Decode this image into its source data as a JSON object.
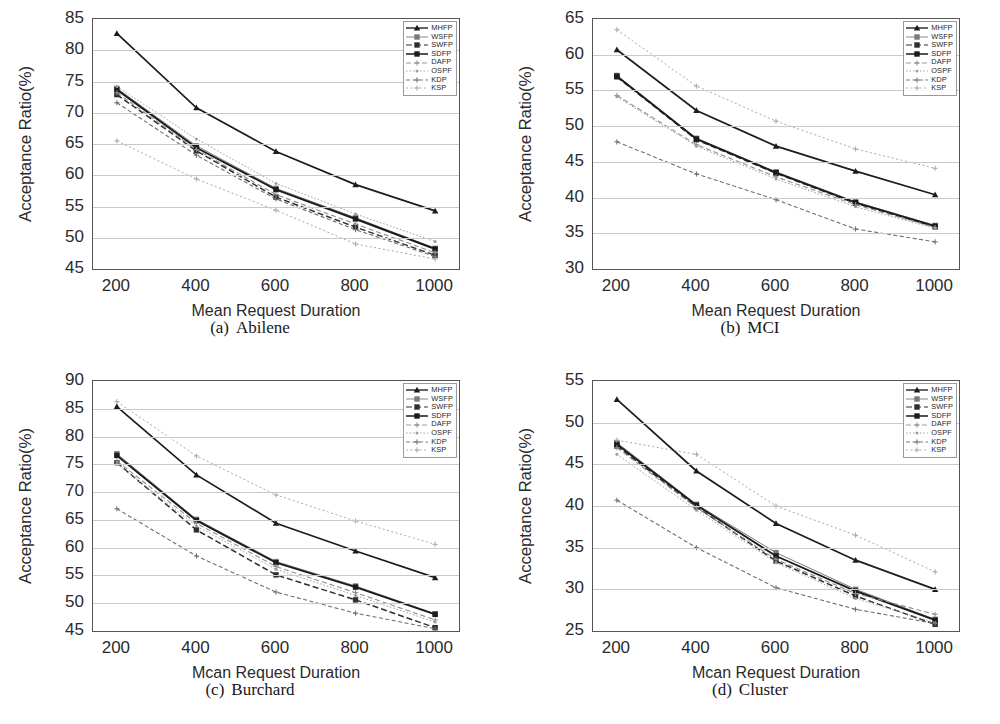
{
  "figure": {
    "xlabel": "Mean Request Duration",
    "xlabel_ocr_alt": "Mcan Request Duration",
    "ylabel": "Acceptance Ratio(%)",
    "series_names": [
      "MHFP",
      "WSFP",
      "SWFP",
      "SDFP",
      "DAFP",
      "OSPF",
      "KDP",
      "KSP"
    ]
  },
  "panels": [
    {
      "tag": "(a)",
      "name": "Abilene",
      "xlabel": "Mean Request Duration",
      "ylabel": "Acceptance Ratio(%)"
    },
    {
      "tag": "(b)",
      "name": "MCI",
      "xlabel": "Mean Request Duration",
      "ylabel": "Acceptance Ratio(%)"
    },
    {
      "tag": "(c)",
      "name": "Burchard",
      "xlabel": "Mcan Request Duration",
      "ylabel": "Acceptance Ratio(%)"
    },
    {
      "tag": "(d)",
      "name": "Cluster",
      "xlabel": "Mcan Request Duration",
      "ylabel": "Acceptance Ratio(%)"
    }
  ],
  "chart_data": [
    {
      "type": "line",
      "title": "(a) Abilene",
      "xlabel": "Mean Request Duration",
      "ylabel": "Acceptance Ratio(%)",
      "x": [
        200,
        400,
        600,
        800,
        1000
      ],
      "xticks": [
        200,
        400,
        600,
        800,
        1000
      ],
      "yticks": [
        45,
        50,
        55,
        60,
        65,
        70,
        75,
        80,
        85
      ],
      "xlim": [
        140,
        1060
      ],
      "ylim": [
        45,
        85
      ],
      "grid": true,
      "legend_position": "top-right",
      "series": [
        {
          "name": "MHFP",
          "values": [
            82.7,
            70.8,
            63.8,
            58.5,
            54.3
          ]
        },
        {
          "name": "WSFP",
          "values": [
            73.9,
            64.7,
            57.9,
            53.2,
            48.3
          ]
        },
        {
          "name": "SWFP",
          "values": [
            72.9,
            63.9,
            56.5,
            51.7,
            47.2
          ]
        },
        {
          "name": "SDFP",
          "values": [
            73.7,
            64.4,
            57.7,
            53.0,
            48.2
          ]
        },
        {
          "name": "DAFP",
          "values": [
            73.2,
            64.1,
            56.9,
            52.2,
            47.6
          ]
        },
        {
          "name": "OSPF",
          "values": [
            74.2,
            65.8,
            58.7,
            53.8,
            49.4
          ]
        },
        {
          "name": "KDP",
          "values": [
            71.6,
            63.2,
            56.2,
            51.3,
            47.0
          ]
        },
        {
          "name": "KSP",
          "values": [
            65.5,
            59.4,
            54.4,
            49.0,
            46.6
          ]
        }
      ]
    },
    {
      "type": "line",
      "title": "(b) MCI",
      "xlabel": "Mean Request Duration",
      "ylabel": "Acceptance Ratio(%)",
      "x": [
        200,
        400,
        600,
        800,
        1000
      ],
      "xticks": [
        200,
        400,
        600,
        800,
        1000
      ],
      "yticks": [
        30,
        35,
        40,
        45,
        50,
        55,
        60,
        65
      ],
      "xlim": [
        140,
        1060
      ],
      "ylim": [
        30,
        65
      ],
      "grid": true,
      "legend_position": "top-right",
      "series": [
        {
          "name": "MHFP",
          "values": [
            60.7,
            52.2,
            47.2,
            43.7,
            40.4
          ]
        },
        {
          "name": "WSFP",
          "values": [
            57.1,
            48.3,
            43.6,
            39.4,
            36.1
          ]
        },
        {
          "name": "SWFP",
          "values": [
            56.9,
            48.1,
            43.4,
            39.2,
            35.9
          ]
        },
        {
          "name": "SDFP",
          "values": [
            57.0,
            48.2,
            43.5,
            39.3,
            36.0
          ]
        },
        {
          "name": "DAFP",
          "values": [
            54.3,
            47.4,
            42.9,
            39.0,
            35.8
          ]
        },
        {
          "name": "OSPF",
          "values": [
            54.1,
            47.2,
            42.6,
            38.7,
            35.7
          ]
        },
        {
          "name": "KDP",
          "values": [
            47.8,
            43.3,
            39.7,
            35.6,
            33.8
          ]
        },
        {
          "name": "KSP",
          "values": [
            63.5,
            55.6,
            50.7,
            46.8,
            44.1
          ]
        }
      ]
    },
    {
      "type": "line",
      "title": "(c) Burchard",
      "xlabel": "Mcan Request Duration",
      "ylabel": "Acceptance Ratio(%)",
      "x": [
        200,
        400,
        600,
        800,
        1000
      ],
      "xticks": [
        200,
        400,
        600,
        800,
        1000
      ],
      "yticks": [
        45,
        50,
        55,
        60,
        65,
        70,
        75,
        80,
        85,
        90
      ],
      "xlim": [
        140,
        1060
      ],
      "ylim": [
        45,
        90
      ],
      "grid": true,
      "legend_position": "top-right",
      "series": [
        {
          "name": "MHFP",
          "values": [
            85.4,
            73.1,
            64.4,
            59.4,
            54.6
          ]
        },
        {
          "name": "WSFP",
          "values": [
            76.9,
            65.1,
            57.5,
            53.1,
            48.1
          ]
        },
        {
          "name": "SWFP",
          "values": [
            75.3,
            63.2,
            55.1,
            50.6,
            45.6
          ]
        },
        {
          "name": "SDFP",
          "values": [
            76.6,
            64.9,
            57.3,
            52.9,
            48.0
          ]
        },
        {
          "name": "DAFP",
          "values": [
            75.6,
            64.4,
            56.6,
            51.9,
            47.0
          ]
        },
        {
          "name": "OSPF",
          "values": [
            75.1,
            63.9,
            56.1,
            51.4,
            46.6
          ]
        },
        {
          "name": "KDP",
          "values": [
            67.0,
            58.5,
            52.0,
            48.2,
            45.4
          ]
        },
        {
          "name": "KSP",
          "values": [
            86.3,
            76.5,
            69.5,
            64.8,
            60.6
          ]
        }
      ]
    },
    {
      "type": "line",
      "title": "(d) Cluster",
      "xlabel": "Mcan Request Duration",
      "ylabel": "Acceptance Ratio(%)",
      "x": [
        200,
        400,
        600,
        800,
        1000
      ],
      "xticks": [
        200,
        400,
        600,
        800,
        1000
      ],
      "yticks": [
        25,
        30,
        35,
        40,
        45,
        50,
        55
      ],
      "xlim": [
        140,
        1060
      ],
      "ylim": [
        25,
        55
      ],
      "grid": true,
      "legend_position": "top-right",
      "series": [
        {
          "name": "MHFP",
          "values": [
            52.8,
            44.2,
            37.9,
            33.5,
            30.0
          ]
        },
        {
          "name": "WSFP",
          "values": [
            47.6,
            40.2,
            34.4,
            30.0,
            26.4
          ]
        },
        {
          "name": "SWFP",
          "values": [
            47.2,
            39.9,
            33.4,
            29.2,
            25.8
          ]
        },
        {
          "name": "SDFP",
          "values": [
            47.4,
            40.1,
            34.0,
            29.8,
            26.3
          ]
        },
        {
          "name": "DAFP",
          "values": [
            47.0,
            39.8,
            33.6,
            29.5,
            27.0
          ]
        },
        {
          "name": "OSPF",
          "values": [
            46.2,
            39.5,
            33.2,
            28.9,
            26.0
          ]
        },
        {
          "name": "KDP",
          "values": [
            40.7,
            35.0,
            30.2,
            27.6,
            25.9
          ]
        },
        {
          "name": "KSP",
          "values": [
            47.9,
            46.2,
            40.0,
            36.5,
            32.1
          ]
        }
      ]
    }
  ],
  "legend_styles": [
    {
      "name": "MHFP",
      "color": "#1c1c1c",
      "width": 1.7,
      "dash": "none",
      "marker": "triangle"
    },
    {
      "name": "WSFP",
      "color": "#7a7a7a",
      "width": 1.0,
      "dash": "none",
      "marker": "square"
    },
    {
      "name": "SWFP",
      "color": "#2f2f2f",
      "width": 1.5,
      "dash": "6,3",
      "marker": "square"
    },
    {
      "name": "SDFP",
      "color": "#1c1c1c",
      "width": 1.9,
      "dash": "none",
      "marker": "square"
    },
    {
      "name": "DAFP",
      "color": "#8e8e8e",
      "width": 1.1,
      "dash": "5,3",
      "marker": "cross"
    },
    {
      "name": "OSPF",
      "color": "#9c9c9c",
      "width": 1.0,
      "dash": "1.5,2",
      "marker": "dot"
    },
    {
      "name": "KDP",
      "color": "#6d6d6d",
      "width": 1.1,
      "dash": "4,2.5",
      "marker": "cross"
    },
    {
      "name": "KSP",
      "color": "#a8a8a8",
      "width": 1.0,
      "dash": "2,2.5",
      "marker": "cross"
    }
  ]
}
